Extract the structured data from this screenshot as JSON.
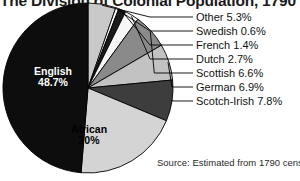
{
  "chart_data": {
    "type": "pie",
    "title": "The Division of Colonial Population, 1790",
    "source": "Source: Estimated from 1790 census",
    "units": "percent",
    "total": 100,
    "categories": [
      "Other",
      "Swedish",
      "French",
      "Dutch",
      "Scottish",
      "German",
      "Scotch-Irish",
      "African",
      "English"
    ],
    "values": [
      5.3,
      0.6,
      1.4,
      2.7,
      6.6,
      6.9,
      7.8,
      20,
      48.7
    ],
    "labels": [
      "Other 5.3%",
      "Swedish 0.6%",
      "French 1.4%",
      "Dutch 2.7%",
      "Scottish 6.6%",
      "German 6.9%",
      "Scotch-Irish 7.8%",
      "African 20%",
      "English 48.7%"
    ],
    "slice_colors": [
      "#c9c9c9",
      "#ffffff",
      "#1a1a1a",
      "#f7f7f7",
      "#8a8a8a",
      "#c2c2c2",
      "#3d3d3d",
      "#d4d4d4",
      "#0d0d0d"
    ],
    "legend_position": "right-leader-lines",
    "grid": false,
    "start_angle_deg": 0,
    "direction": "clockwise"
  },
  "pie": {
    "center_x": 88,
    "center_y": 88,
    "radius": 85,
    "outline_color": "#000000",
    "inner_labels": [
      {
        "key": "english",
        "text_line1": "English",
        "text_line2": "48.7%",
        "text_color": "#ffffff"
      },
      {
        "key": "african",
        "text_line1": "African",
        "text_line2": "20%",
        "text_color": "#000000"
      }
    ]
  },
  "legend": {
    "items": [
      {
        "name": "Other",
        "text": "Other 5.3%"
      },
      {
        "name": "Swedish",
        "text": "Swedish 0.6%"
      },
      {
        "name": "French",
        "text": "French 1.4%"
      },
      {
        "name": "Dutch",
        "text": "Dutch 2.7%"
      },
      {
        "name": "Scottish",
        "text": "Scottish 6.6%"
      },
      {
        "name": "German",
        "text": "German 6.9%"
      },
      {
        "name": "Scotch-Irish",
        "text": "Scotch-Irish 7.8%"
      }
    ]
  }
}
